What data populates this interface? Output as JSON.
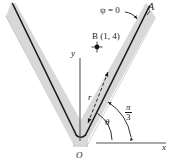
{
  "figure": {
    "background_color": "#ffffff",
    "arm_band_color": "#d8d8d8",
    "arm_line_color": "#1a1a1a",
    "axis_color": "#5a5a5a",
    "text_color": "#1a1a1a"
  },
  "labels": {
    "point_A": "A",
    "psi_condition": "ψ = 0",
    "point_B": "B (1, 4)",
    "y_axis": "y",
    "x_axis": "x",
    "radius": "r",
    "theta": "θ",
    "origin": "O",
    "angle_numerator": "π",
    "angle_denominator": "3"
  },
  "geometry": {
    "origin_px": [
      80,
      140
    ],
    "right_arm_tip_px": [
      150,
      10
    ],
    "left_arm_tip_px": [
      6,
      8
    ],
    "point_B_px": [
      97,
      47
    ],
    "right_arm_angle_deg": 60,
    "left_arm_angle_deg": 118,
    "theta_arc_radius_px": 34,
    "pi3_arc_radius_px": 52
  },
  "values": {
    "B_coordinates": [
      1,
      4
    ],
    "psi": 0,
    "wedge_angle": "π/3"
  }
}
